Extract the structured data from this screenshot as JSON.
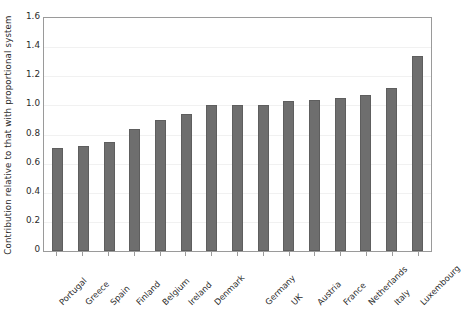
{
  "chart_data": {
    "type": "bar",
    "title": "",
    "subtitle": "",
    "xlabel": "",
    "ylabel": "Contribution relative to that with proportional system",
    "ylim": [
      0,
      1.6
    ],
    "ytick_labels": [
      "0",
      "0.2",
      "0.4",
      "0.6",
      "0.8",
      "1.0",
      "1.2",
      "1.4",
      "1.6"
    ],
    "ytick_values": [
      0,
      0.2,
      0.4,
      0.6,
      0.8,
      1.0,
      1.2,
      1.4,
      1.6
    ],
    "grid": true,
    "grid_axis": "y",
    "legend": "none",
    "bar_color": "#6e6e6e",
    "bar_edge_color": "#5e5e5e",
    "frame_color": "#9a9a9a",
    "gridline_color": "#f1f1f1",
    "xtick_label_rotation": 45,
    "categories": [
      "Portugal",
      "Greece",
      "Spain",
      "Finland",
      "Belgium",
      "Ireland",
      "Denmark",
      "Germany",
      "UK",
      "Austria",
      "France",
      "Netherlands",
      "Italy",
      "Luxembourg"
    ],
    "values": [
      0.71,
      0.72,
      0.75,
      0.84,
      0.9,
      0.94,
      1.0,
      1.0,
      1.03,
      1.04,
      1.05,
      1.07,
      1.12,
      1.34
    ],
    "series": [
      {
        "name": "Contribution relative to proportional system",
        "values": [
          0.71,
          0.72,
          0.75,
          0.84,
          0.9,
          0.94,
          1.0,
          1.0,
          1.03,
          1.04,
          1.05,
          1.07,
          1.12,
          1.34
        ]
      }
    ],
    "bar_count": 15,
    "note_top_clipped_text": "……"
  }
}
